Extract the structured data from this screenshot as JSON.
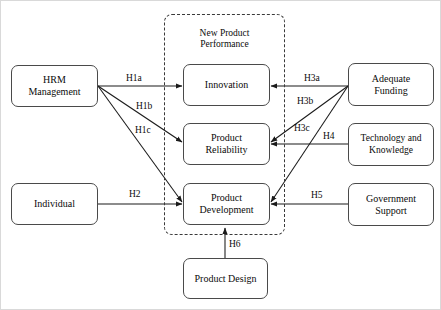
{
  "diagram": {
    "group": {
      "label_line1": "New Product",
      "label_line2": "Performance"
    },
    "nodes": [
      {
        "id": "hrm",
        "line1": "HRM",
        "line2": "Management"
      },
      {
        "id": "individual",
        "line1": "Individual",
        "line2": ""
      },
      {
        "id": "innovation",
        "line1": "Innovation",
        "line2": ""
      },
      {
        "id": "reliability",
        "line1": "Product",
        "line2": "Reliability"
      },
      {
        "id": "development",
        "line1": "Product",
        "line2": "Development"
      },
      {
        "id": "design",
        "line1": "Product Design",
        "line2": ""
      },
      {
        "id": "funding",
        "line1": "Adequate",
        "line2": "Funding"
      },
      {
        "id": "technology",
        "line1": "Technology and",
        "line2": "Knowledge"
      },
      {
        "id": "government",
        "line1": "Government",
        "line2": "Support"
      }
    ],
    "edges": [
      {
        "id": "h1a",
        "label": "H1a",
        "from": "hrm",
        "to": "innovation"
      },
      {
        "id": "h1b",
        "label": "H1b",
        "from": "hrm",
        "to": "reliability"
      },
      {
        "id": "h1c",
        "label": "H1c",
        "from": "hrm",
        "to": "development"
      },
      {
        "id": "h2",
        "label": "H2",
        "from": "individual",
        "to": "development"
      },
      {
        "id": "h3a",
        "label": "H3a",
        "from": "funding",
        "to": "innovation"
      },
      {
        "id": "h3b",
        "label": "H3b",
        "from": "funding",
        "to": "reliability"
      },
      {
        "id": "h3c",
        "label": "H3c",
        "from": "funding",
        "to": "development"
      },
      {
        "id": "h4",
        "label": "H4",
        "from": "technology",
        "to": "reliability"
      },
      {
        "id": "h5",
        "label": "H5",
        "from": "government",
        "to": "development"
      },
      {
        "id": "h6",
        "label": "H6",
        "from": "design",
        "to": "development"
      }
    ],
    "colors": {
      "node_border": "#4a4a4a",
      "node_fill": "#ffffff",
      "line": "#1a1a1a",
      "dashed_border": "#3a3a3a",
      "text": "#0b0b0b",
      "frame": "#d9d9d9"
    }
  }
}
